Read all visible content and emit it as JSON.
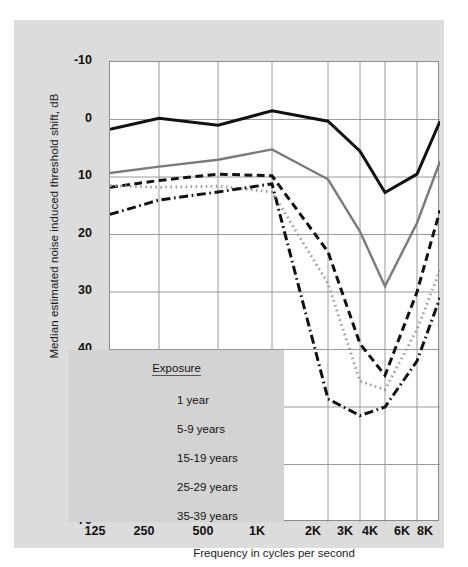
{
  "chart_data": {
    "type": "line",
    "title": "",
    "xlabel": "Frequency in cycles per second",
    "ylabel": "Median estimated noise induced threshold shift, dB",
    "x_tick_labels": [
      "125",
      "250",
      "500",
      "1K",
      "2K",
      "3K",
      "4K",
      "6K",
      "8K"
    ],
    "x_values": [
      125,
      250,
      500,
      1000,
      2000,
      3000,
      4000,
      6000,
      8000
    ],
    "x_scale": "log",
    "y_tick_labels": [
      "-10",
      "0",
      "10",
      "20",
      "30",
      "40",
      "50",
      "60",
      "70"
    ],
    "y_ticks": [
      -10,
      0,
      10,
      20,
      30,
      40,
      50,
      60,
      70
    ],
    "ylim": [
      -10,
      70
    ],
    "y_inverted": true,
    "grid": true,
    "legend_position": "lower-left-inside",
    "legend_title": "Exposure",
    "series": [
      {
        "name": "1 year",
        "style": "solid",
        "color": "#111111",
        "width": 3,
        "values": [
          1.7,
          -0.2,
          1.0,
          -1.5,
          0.3,
          5.5,
          12.7,
          9.5,
          0.3
        ]
      },
      {
        "name": "5-9 years",
        "style": "solid",
        "color": "#7a7a7a",
        "width": 2.4,
        "values": [
          9.3,
          8.2,
          7.0,
          5.2,
          10.4,
          19.5,
          29.0,
          18.0,
          7.3
        ]
      },
      {
        "name": "15-19 years",
        "style": "dashed",
        "color": "#111111",
        "width": 3,
        "values": [
          11.8,
          10.6,
          9.5,
          9.8,
          23.0,
          39.0,
          44.5,
          30.0,
          15.8
        ]
      },
      {
        "name": "25-29 years",
        "style": "dotted",
        "color": "#9a9a9a",
        "width": 2.8,
        "values": [
          11.5,
          11.8,
          11.6,
          12.6,
          28.5,
          45.5,
          47.0,
          36.5,
          26.2
        ]
      },
      {
        "name": "35-39 years",
        "style": "dashdot",
        "color": "#111111",
        "width": 3,
        "values": [
          16.5,
          14.0,
          12.6,
          11.2,
          48.6,
          51.5,
          50.0,
          42.0,
          31.0
        ]
      }
    ]
  },
  "legend": {
    "title": "Exposure",
    "items": [
      {
        "label": "1 year"
      },
      {
        "label": "5-9 years"
      },
      {
        "label": "15-19 years"
      },
      {
        "label": "25-29 years"
      },
      {
        "label": "35-39 years"
      }
    ]
  },
  "colors": {
    "panel_background": "#dcdcdc",
    "plot_background": "#ffffff",
    "grid": "#9a9a9a",
    "frame": "#8c8c8c",
    "legend_background": "#d3d3d3",
    "text": "#111111"
  }
}
